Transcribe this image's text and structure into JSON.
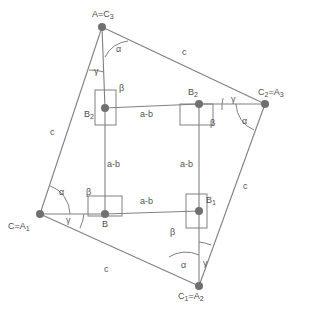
{
  "figure": {
    "colors": {
      "line": "#808080",
      "vertex": "#707070",
      "text": "#4d4d4d",
      "background": "#ffffff"
    },
    "vertices": [
      {
        "id": "A",
        "label_html": "A=C<sub>3</sub>",
        "x": 102,
        "y": 27,
        "label_x": 92,
        "label_y": 10
      },
      {
        "id": "C2",
        "label_html": "C<sub>2</sub>=A<sub>3</sub>",
        "x": 265,
        "y": 104,
        "label_x": 258,
        "label_y": 88
      },
      {
        "id": "C1",
        "label_html": "C<sub>1</sub>=A<sub>2</sub>",
        "x": 199,
        "y": 286,
        "label_x": 178,
        "label_y": 292
      },
      {
        "id": "C",
        "label_html": "C=A<sub>1</sub>",
        "x": 40,
        "y": 214,
        "label_x": 8,
        "label_y": 222
      }
    ],
    "inner_points": [
      {
        "id": "B2L",
        "label_html": "B<sub>2</sub>",
        "x": 105,
        "y": 108,
        "label_x": 84,
        "label_y": 110
      },
      {
        "id": "B2R",
        "label_html": "B<sub>2</sub>",
        "x": 199,
        "y": 104,
        "label_x": 188,
        "label_y": 88
      },
      {
        "id": "B1",
        "label_html": "B<sub>1</sub>",
        "x": 199,
        "y": 211,
        "label_x": 206,
        "label_y": 196
      },
      {
        "id": "B",
        "label_html": "B",
        "x": 105,
        "y": 214,
        "label_x": 102,
        "label_y": 220
      }
    ],
    "side_labels": [
      {
        "text": "c",
        "x": 182,
        "y": 48
      },
      {
        "text": "c",
        "x": 243,
        "y": 182
      },
      {
        "text": "c",
        "x": 104,
        "y": 265
      },
      {
        "text": "c",
        "x": 50,
        "y": 128
      }
    ],
    "segment_labels": [
      {
        "text": "a-b",
        "x": 140,
        "y": 110
      },
      {
        "text": "a-b",
        "x": 140,
        "y": 197
      },
      {
        "text": "a-b",
        "x": 107,
        "y": 160
      },
      {
        "text": "a-b",
        "x": 180,
        "y": 160
      }
    ],
    "angle_labels": [
      {
        "text": "α",
        "x": 116,
        "y": 45
      },
      {
        "text": "γ",
        "x": 94,
        "y": 67
      },
      {
        "text": "γ",
        "x": 231,
        "y": 95
      },
      {
        "text": "α",
        "x": 242,
        "y": 117
      },
      {
        "text": "α",
        "x": 59,
        "y": 188
      },
      {
        "text": "γ",
        "x": 66,
        "y": 216
      },
      {
        "text": "α",
        "x": 181,
        "y": 261
      },
      {
        "text": "γ",
        "x": 203,
        "y": 259
      },
      {
        "text": "β",
        "x": 119,
        "y": 84
      },
      {
        "text": "β",
        "x": 210,
        "y": 119
      },
      {
        "text": "β",
        "x": 86,
        "y": 188
      },
      {
        "text": "β",
        "x": 170,
        "y": 228
      }
    ],
    "notation": {
      "side_c": "c",
      "segment_ab": "a-b",
      "alpha": "α",
      "beta": "β",
      "gamma": "γ"
    }
  }
}
